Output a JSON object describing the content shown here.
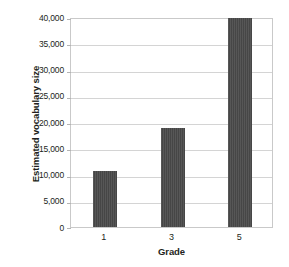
{
  "chart_data": {
    "type": "bar",
    "title": "",
    "subtitle": "",
    "xlabel": "Grade",
    "ylabel": "Estimated vocabulary size",
    "categories": [
      "1",
      "3",
      "5"
    ],
    "values": [
      10600,
      18800,
      39800
    ],
    "series": [
      {
        "name": "Estimated vocabulary size",
        "values": [
          10600,
          18800,
          39800
        ]
      }
    ],
    "ylim": [
      0,
      40000
    ],
    "ytick_step": 5000,
    "ytick_labels": [
      "40,000",
      "35,000",
      "30,000",
      "25,000",
      "20,000",
      "15,000",
      "10,000",
      "5,000",
      "0"
    ],
    "ytick_values": [
      40000,
      35000,
      30000,
      25000,
      20000,
      15000,
      10000,
      5000,
      0
    ],
    "xtick_labels": [
      "1",
      "3",
      "5"
    ],
    "grid": "horizontal",
    "legend": "none",
    "annotations": [],
    "colors": {
      "bar": "#4a4a4a",
      "gridline": "#d4d4d4",
      "axis_frame": "#c9c9c9",
      "text": "#231f20",
      "background": "#ffffff"
    }
  }
}
